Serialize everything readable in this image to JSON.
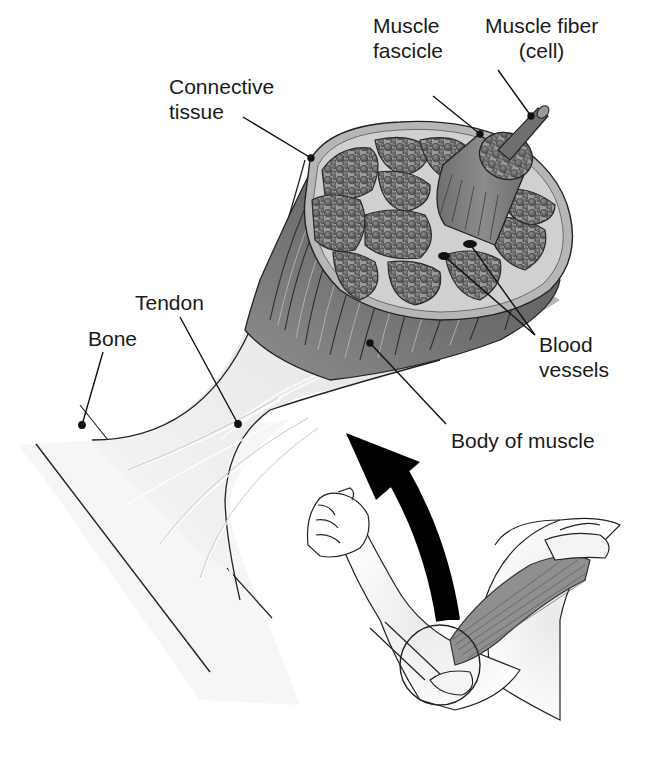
{
  "diagram": {
    "colors": {
      "background": "#ffffff",
      "muscle_dark": "#5e5e5e",
      "muscle_mid": "#7a7a7a",
      "fascicle_fill": "#8a8a8a",
      "fiber_fill": "#6a6a6a",
      "sheath": "#b8b8b8",
      "tendon_light": "#efefef",
      "arrow": "#000000",
      "line": "#1a1a1a",
      "text": "#1a1a1a"
    },
    "labels": {
      "muscle_fascicle": "Muscle\nfascicle",
      "muscle_fiber": "Muscle fiber\n(cell)",
      "connective_tissue": "Connective\ntissue",
      "tendon": "Tendon",
      "bone": "Bone",
      "blood_vessels": "Blood\nvessels",
      "body_of_muscle": "Body of muscle"
    },
    "inset": {
      "description": "Flexed arm with biceps highlighted; curved arrow indicates zoom from elbow region",
      "magnifier": "circle"
    }
  }
}
